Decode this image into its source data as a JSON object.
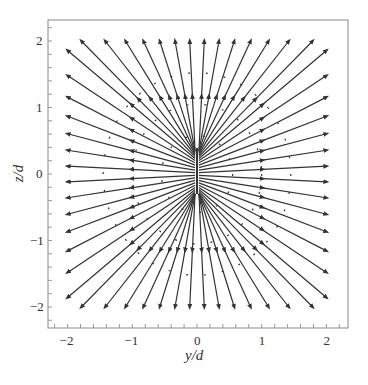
{
  "chart_data": {
    "type": "vector-field",
    "title": "",
    "xlabel": "y/d",
    "ylabel": "z/d",
    "xlim": [
      -2.2,
      2.3
    ],
    "ylim": [
      -2.3,
      2.3
    ],
    "xticks": [
      -2,
      -1,
      0,
      1,
      2
    ],
    "yticks": [
      -2,
      -1,
      0,
      1,
      2
    ],
    "xtick_labels": [
      "−2",
      "−1",
      "0",
      "1",
      "2"
    ],
    "ytick_labels": [
      "2",
      "1",
      "0",
      "−1",
      "−2"
    ],
    "grid": false,
    "source_segment": {
      "y": 0,
      "z_min": -0.3,
      "z_max": 0.4
    },
    "n_field_lines": 56,
    "arrow_direction": "outward",
    "line_color": "#333333",
    "frame_color": "#888888"
  },
  "axes": {
    "x_label": "y/d",
    "y_label": "z/d"
  }
}
